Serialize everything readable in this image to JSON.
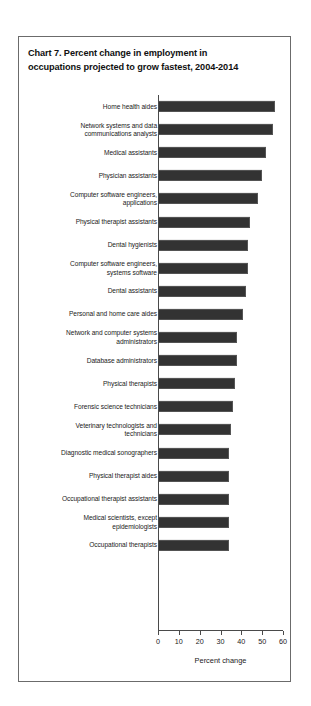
{
  "chart_data": {
    "type": "bar",
    "orientation": "horizontal",
    "title": "Chart 7.  Percent change in employment in occupations projected to grow fastest, 2004-2014",
    "title_line1": "Chart 7.  Percent change in employment in",
    "title_line2": "occupations projected to grow fastest, 2004-2014",
    "xlabel": "Percent change",
    "ylabel": "",
    "xlim": [
      0,
      60
    ],
    "xticks": [
      0,
      10,
      20,
      30,
      40,
      50,
      60
    ],
    "xtick_labels": [
      "0",
      "10",
      "20",
      "30",
      "40",
      "50",
      "60"
    ],
    "grid": false,
    "legend": false,
    "bar_color": "#333333",
    "categories": [
      "Home health aides",
      "Network systems and data\ncommunications analysts",
      "Medical assistants",
      "Physician assistants",
      "Computer software engineers,\napplications",
      "Physical therapist assistants",
      "Dental hygienists",
      "Computer software engineers,\nsystems software",
      "Dental assistants",
      "Personal and home care aides",
      "Network and computer systems\nadministrators",
      "Database administrators",
      "Physical therapists",
      "Forensic science technicians",
      "Veterinary technologists and\ntechnicians",
      "Diagnostic medical sonographers",
      "Physical therapist aides",
      "Occupational therapist assistants",
      "Medical scientists, except\nepidemiologists",
      "Occupational therapists"
    ],
    "values": [
      56,
      55,
      52,
      50,
      48,
      44,
      43,
      43,
      42,
      41,
      38,
      38,
      37,
      36,
      35,
      34,
      34,
      34,
      34,
      34
    ]
  }
}
